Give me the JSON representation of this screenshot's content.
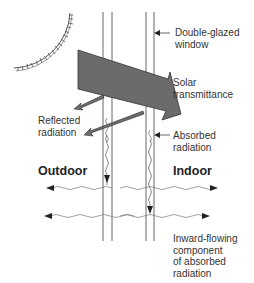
{
  "diagram": {
    "colors": {
      "arrow_fill": "#6b6b6b",
      "arrow_stroke": "#333333",
      "line": "#555555",
      "text": "#333333",
      "background": "#ffffff"
    },
    "labels": {
      "window": "Double-glazed\nwindow",
      "solar_transmittance": "Solar\ntransmittance",
      "reflected": "Reflected\nradiation",
      "absorbed": "Absorbed\nradiation",
      "outdoor": "Outdoor",
      "indoor": "Indoor",
      "inward": "Inward-flowing\ncomponent\nof absorbed\nradiation"
    },
    "icons": [
      "sun-icon"
    ]
  }
}
